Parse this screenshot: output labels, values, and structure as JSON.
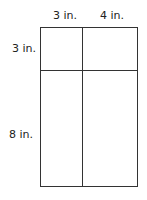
{
  "diagram": {
    "type": "area-model-rectangle",
    "top_labels": [
      "3 in.",
      "4 in."
    ],
    "side_labels": [
      "3 in.",
      "8 in."
    ],
    "line_color": "#333333"
  }
}
